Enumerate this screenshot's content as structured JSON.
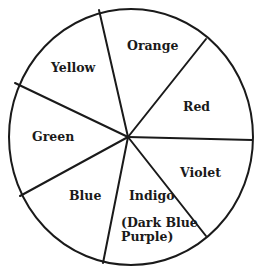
{
  "diagram": {
    "type": "color-wheel",
    "segments": [
      {
        "name": "orange",
        "label": "Orange"
      },
      {
        "name": "red",
        "label": "Red"
      },
      {
        "name": "violet",
        "label": "Violet"
      },
      {
        "name": "indigo",
        "label": "Indigo"
      },
      {
        "name": "blue",
        "label": "Blue"
      },
      {
        "name": "green",
        "label": "Green"
      },
      {
        "name": "yellow",
        "label": "Yellow"
      }
    ],
    "indigo_note": "(Dark Blue\nPurple)"
  }
}
